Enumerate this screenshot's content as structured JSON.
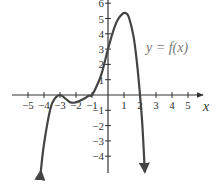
{
  "chart_data": {
    "type": "line",
    "title": "",
    "xlabel": "x",
    "ylabel": "",
    "xlim": [
      -5.5,
      5.8
    ],
    "ylim": [
      -5,
      6.2
    ],
    "grid": false,
    "annotations": [
      {
        "text": "y = f(x)",
        "x": 3.3,
        "y": 3
      }
    ],
    "x_ticks": [
      -5,
      -4,
      -3,
      -2,
      -1,
      1,
      2,
      3,
      4,
      5
    ],
    "x_tick_labels": [
      "−5",
      "−4",
      "−3",
      "−2",
      "−1",
      "1",
      "2",
      "3",
      "4",
      "5"
    ],
    "y_ticks": [
      -4,
      -3,
      -2,
      -1,
      1,
      2,
      3,
      4,
      5,
      6
    ],
    "y_tick_labels": [
      "−4",
      "−3",
      "−2",
      "−1",
      "1",
      "2",
      "3",
      "4",
      "5",
      "6"
    ],
    "series": [
      {
        "name": "f(x)",
        "color": "#444444",
        "arrows": "both-ends-downward",
        "x": [
          -4.2,
          -4.0,
          -3.6,
          -3.3,
          -3.0,
          -2.7,
          -2.4,
          -2.1,
          -1.8,
          -1.5,
          -1.2,
          -1.0,
          -0.7,
          -0.4,
          0.0,
          0.3,
          0.6,
          0.9,
          1.1,
          1.3,
          1.6,
          1.8,
          2.0,
          2.15,
          2.3
        ],
        "y": [
          -5.0,
          -3.2,
          -0.9,
          -0.2,
          0.0,
          -0.2,
          -0.45,
          -0.5,
          -0.4,
          -0.25,
          -0.05,
          0.0,
          0.6,
          1.4,
          3.0,
          4.1,
          4.9,
          5.3,
          5.35,
          5.1,
          3.8,
          2.2,
          0.0,
          -2.0,
          -5.0
        ]
      }
    ],
    "key_points": {
      "roots": [
        -3,
        -1,
        2
      ],
      "local_max": [
        1.1,
        5.35
      ],
      "local_min": [
        -2.1,
        -0.5
      ],
      "touch_point": [
        -3,
        0
      ],
      "y_intercept": 3
    }
  },
  "labels": {
    "function": "y = f(x)",
    "x_axis": "x"
  },
  "colors": {
    "curve": "#444444",
    "axis": "#333333",
    "label": "#777777"
  }
}
